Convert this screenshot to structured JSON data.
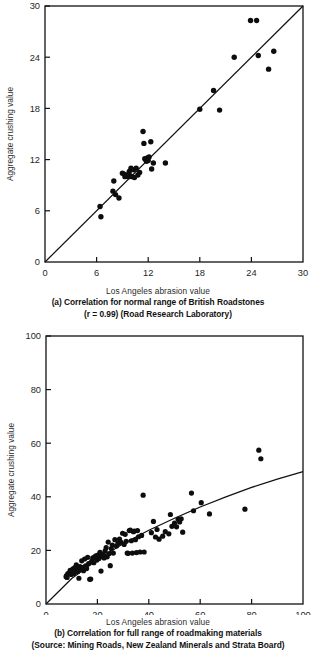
{
  "figure": {
    "panel_count": 2
  },
  "chart_data": [
    {
      "id": "panel-a",
      "type": "scatter",
      "title": "",
      "xlabel": "Los Angeles abrasion value",
      "ylabel": "Aggregate crushing value",
      "xlim": [
        0,
        30
      ],
      "ylim": [
        0,
        30
      ],
      "xticks": [
        0,
        6,
        12,
        18,
        24,
        30
      ],
      "yticks": [
        0,
        6,
        12,
        18,
        24,
        30
      ],
      "xticklabels": [
        "0",
        "6",
        "12",
        "18",
        "24",
        "30"
      ],
      "yticklabels": [
        "0",
        "6",
        "12",
        "18",
        "24",
        "30"
      ],
      "grid": false,
      "legend": "none",
      "caption_axis": "Los Angeles abrasion value",
      "caption_lines": [
        "(a)  Correlation for normal range of British Roadstones",
        "(r = 0.99) (Road Research Laboratory)"
      ],
      "correlation_r": "0.99",
      "source": "Road Research Laboratory",
      "fit_line": {
        "type": "linear",
        "points": [
          [
            0,
            0
          ],
          [
            30,
            30
          ]
        ],
        "description": "1:1 line through origin"
      },
      "points": [
        [
          6.4,
          6.5
        ],
        [
          6.5,
          5.3
        ],
        [
          7.9,
          8.3
        ],
        [
          8.0,
          9.5
        ],
        [
          8.2,
          7.9
        ],
        [
          8.6,
          7.5
        ],
        [
          9.0,
          10.4
        ],
        [
          9.2,
          10.3
        ],
        [
          9.3,
          10.0
        ],
        [
          9.4,
          10.2
        ],
        [
          9.6,
          10.1
        ],
        [
          9.7,
          10.0
        ],
        [
          9.8,
          10.6
        ],
        [
          9.9,
          10.1
        ],
        [
          10.0,
          11.0
        ],
        [
          10.1,
          10.0
        ],
        [
          10.3,
          10.8
        ],
        [
          10.4,
          9.9
        ],
        [
          10.6,
          11.0
        ],
        [
          10.8,
          10.2
        ],
        [
          11.0,
          10.5
        ],
        [
          11.4,
          15.3
        ],
        [
          11.5,
          13.9
        ],
        [
          11.6,
          12.1
        ],
        [
          11.7,
          12.0
        ],
        [
          11.8,
          11.8
        ],
        [
          11.9,
          12.2
        ],
        [
          12.0,
          11.9
        ],
        [
          12.1,
          12.3
        ],
        [
          12.3,
          14.1
        ],
        [
          12.4,
          10.9
        ],
        [
          12.6,
          11.6
        ],
        [
          14.0,
          11.6
        ],
        [
          18.0,
          17.9
        ],
        [
          19.6,
          20.1
        ],
        [
          20.3,
          17.8
        ],
        [
          22.0,
          24.0
        ],
        [
          23.9,
          28.3
        ],
        [
          24.6,
          28.3
        ],
        [
          24.8,
          24.2
        ],
        [
          26.0,
          22.6
        ],
        [
          26.6,
          24.7
        ]
      ]
    },
    {
      "id": "panel-b",
      "type": "scatter",
      "title": "",
      "xlabel": "Los Angeles abrasion value",
      "ylabel": "Aggregate crushing value",
      "xlim": [
        0,
        100
      ],
      "ylim": [
        0,
        100
      ],
      "xticks": [
        0,
        20,
        40,
        60,
        80,
        100
      ],
      "yticks": [
        0,
        20,
        40,
        60,
        80,
        100
      ],
      "xticklabels": [
        "0",
        "20",
        "40",
        "60",
        "80",
        "100"
      ],
      "yticklabels": [
        "0",
        "20",
        "40",
        "60",
        "80",
        "100"
      ],
      "grid": false,
      "legend": "none",
      "caption_axis": "Los Angeles abrasion value",
      "caption_lines": [
        "(b)  Correlation for full range of roadmaking materials",
        "(Source: Mining Roads, New Zealand Minerals and Strata Board)"
      ],
      "fit_line": {
        "type": "curve",
        "points": [
          [
            0,
            0
          ],
          [
            10,
            9.5
          ],
          [
            20,
            16.5
          ],
          [
            30,
            22.5
          ],
          [
            40,
            27.5
          ],
          [
            50,
            32.0
          ],
          [
            60,
            36.2
          ],
          [
            70,
            40.0
          ],
          [
            80,
            43.5
          ],
          [
            90,
            46.6
          ],
          [
            100,
            49.4
          ]
        ],
        "description": "concave-down trend curve from origin to (100, 49)"
      },
      "points": [
        [
          7.8,
          10.2
        ],
        [
          8.0,
          10.6
        ],
        [
          8.2,
          9.9
        ],
        [
          8.5,
          11.3
        ],
        [
          9.4,
          12.6
        ],
        [
          9.8,
          11.0
        ],
        [
          10.2,
          12.2
        ],
        [
          10.5,
          13.1
        ],
        [
          10.8,
          11.4
        ],
        [
          11.2,
          13.6
        ],
        [
          11.5,
          12.2
        ],
        [
          11.8,
          14.6
        ],
        [
          12.1,
          13.4
        ],
        [
          12.4,
          12.1
        ],
        [
          12.8,
          9.6
        ],
        [
          13.2,
          14.0
        ],
        [
          13.6,
          13.0
        ],
        [
          13.9,
          16.1
        ],
        [
          14.2,
          13.6
        ],
        [
          14.6,
          12.4
        ],
        [
          15.0,
          16.8
        ],
        [
          15.4,
          14.2
        ],
        [
          15.8,
          13.2
        ],
        [
          16.2,
          17.4
        ],
        [
          16.6,
          15.1
        ],
        [
          17.0,
          9.2
        ],
        [
          17.4,
          9.3
        ],
        [
          17.8,
          16.0
        ],
        [
          18.2,
          17.2
        ],
        [
          18.6,
          15.4
        ],
        [
          19.0,
          17.6
        ],
        [
          19.4,
          18.0
        ],
        [
          19.8,
          16.4
        ],
        [
          20.2,
          18.2
        ],
        [
          20.6,
          17.0
        ],
        [
          21.0,
          19.3
        ],
        [
          21.4,
          12.3
        ],
        [
          21.8,
          17.8
        ],
        [
          22.2,
          18.6
        ],
        [
          22.6,
          17.2
        ],
        [
          23.0,
          19.8
        ],
        [
          23.4,
          21.0
        ],
        [
          23.8,
          17.6
        ],
        [
          24.2,
          23.1
        ],
        [
          24.6,
          18.8
        ],
        [
          25.0,
          14.3
        ],
        [
          25.4,
          20.7
        ],
        [
          25.8,
          22.0
        ],
        [
          26.2,
          19.0
        ],
        [
          26.8,
          24.0
        ],
        [
          27.4,
          21.6
        ],
        [
          28.0,
          22.6
        ],
        [
          28.6,
          24.2
        ],
        [
          29.2,
          23.0
        ],
        [
          29.8,
          26.4
        ],
        [
          30.4,
          22.2
        ],
        [
          30.8,
          26.0
        ],
        [
          31.2,
          23.4
        ],
        [
          31.6,
          19.0
        ],
        [
          32.0,
          18.9
        ],
        [
          32.4,
          27.4
        ],
        [
          32.8,
          27.6
        ],
        [
          33.2,
          23.6
        ],
        [
          33.6,
          19.0
        ],
        [
          34.0,
          27.0
        ],
        [
          34.4,
          27.2
        ],
        [
          34.8,
          24.0
        ],
        [
          35.2,
          19.2
        ],
        [
          35.6,
          27.4
        ],
        [
          36.0,
          25.1
        ],
        [
          36.6,
          19.4
        ],
        [
          37.2,
          25.6
        ],
        [
          37.8,
          40.6
        ],
        [
          38.2,
          19.4
        ],
        [
          41.0,
          26.6
        ],
        [
          41.8,
          30.8
        ],
        [
          42.6,
          25.0
        ],
        [
          43.2,
          27.8
        ],
        [
          44.0,
          24.2
        ],
        [
          45.4,
          25.3
        ],
        [
          46.4,
          27.0
        ],
        [
          47.8,
          26.2
        ],
        [
          48.4,
          33.4
        ],
        [
          49.0,
          29.0
        ],
        [
          50.0,
          30.2
        ],
        [
          50.8,
          28.8
        ],
        [
          51.4,
          31.6
        ],
        [
          52.0,
          30.6
        ],
        [
          52.6,
          31.8
        ],
        [
          53.2,
          26.8
        ],
        [
          56.6,
          41.4
        ],
        [
          57.4,
          34.8
        ],
        [
          60.4,
          37.8
        ],
        [
          63.6,
          33.6
        ],
        [
          77.4,
          35.4
        ],
        [
          82.8,
          57.4
        ],
        [
          83.6,
          54.2
        ]
      ]
    }
  ]
}
